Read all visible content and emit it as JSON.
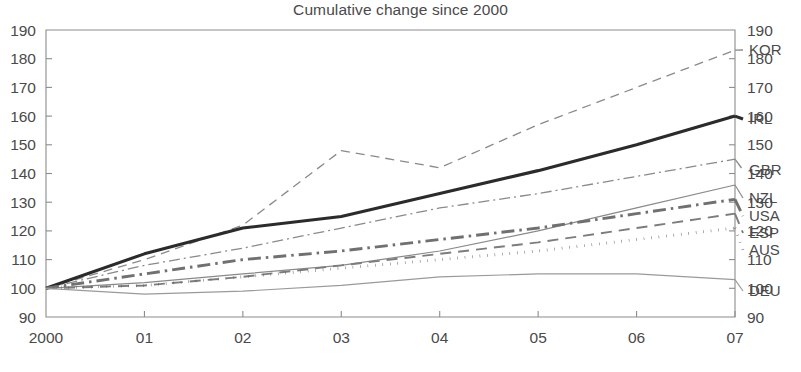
{
  "chart_data": {
    "type": "line",
    "title": "Cumulative change since 2000",
    "xlabel": "",
    "ylabel": "",
    "ylim": [
      90,
      190
    ],
    "ytick_labels": [
      "190",
      "180",
      "170",
      "160",
      "150",
      "140",
      "130",
      "120",
      "110",
      "100",
      "90"
    ],
    "ytick_values": [
      190,
      180,
      170,
      160,
      150,
      140,
      130,
      120,
      110,
      100,
      90
    ],
    "right_axis": true,
    "right_ytick_labels": [
      "190",
      "180",
      "170",
      "160",
      "150",
      "140",
      "130",
      "120",
      "110",
      "100",
      "90"
    ],
    "grid": false,
    "legend_position": "right-inline-labels",
    "x": [
      2000,
      2001,
      2002,
      2003,
      2004,
      2005,
      2006,
      2007
    ],
    "xtick_labels": [
      "2000",
      "01",
      "02",
      "03",
      "04",
      "05",
      "06",
      "07"
    ],
    "series": [
      {
        "name": "KOR",
        "label": "KOR",
        "style": "dashed",
        "color": "#8a8a8a",
        "width": 1.3,
        "dasharray": "9,6",
        "values": [
          100,
          110,
          122,
          148,
          142,
          157,
          170,
          183
        ]
      },
      {
        "name": "IRL",
        "label": "IRL",
        "style": "solid-thick",
        "color": "#2b2b2b",
        "width": 3.1,
        "dasharray": "",
        "values": [
          100,
          112,
          121,
          125,
          133,
          141,
          150,
          160
        ]
      },
      {
        "name": "GBR",
        "label": "GBR",
        "style": "dash-dot-thin",
        "color": "#8a8a8a",
        "width": 1.3,
        "dasharray": "11,4,2,4",
        "values": [
          100,
          108,
          114,
          121,
          128,
          133,
          139,
          145
        ]
      },
      {
        "name": "NZL",
        "label": "NZL",
        "style": "solid-thin",
        "color": "#8a8a8a",
        "width": 1.2,
        "dasharray": "",
        "values": [
          100,
          102,
          105,
          108,
          113,
          120,
          128,
          136
        ]
      },
      {
        "name": "USA",
        "label": "USA",
        "style": "dash-dot-thick",
        "color": "#707070",
        "width": 2.9,
        "dasharray": "13,5,2.5,5",
        "values": [
          100,
          105,
          110,
          113,
          117,
          121,
          126,
          131
        ]
      },
      {
        "name": "ESP",
        "label": "ESP",
        "style": "dashed-medium",
        "color": "#7c7c7c",
        "width": 1.9,
        "dasharray": "11,7",
        "values": [
          100,
          101,
          104,
          108,
          112,
          116,
          121,
          126
        ]
      },
      {
        "name": "AUS",
        "label": "AUS",
        "style": "dotted-thick",
        "color": "#5f5f5f",
        "width": 2.9,
        "dasharray": "0.5,7",
        "values": [
          100,
          101,
          104,
          107,
          110,
          113,
          117,
          121
        ]
      },
      {
        "name": "DEU",
        "label": "DEU",
        "style": "solid-thin",
        "color": "#9a9a9a",
        "width": 1.2,
        "dasharray": "",
        "values": [
          100,
          98,
          99,
          101,
          104,
          105,
          105,
          103
        ]
      }
    ]
  }
}
